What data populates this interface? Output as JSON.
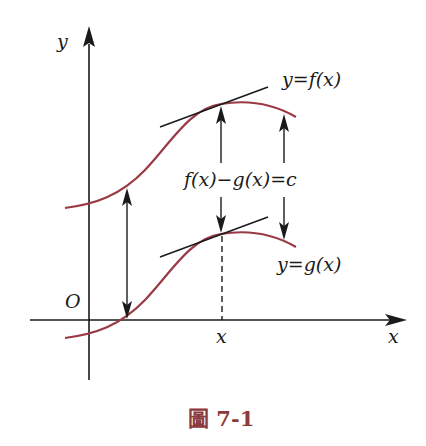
{
  "figure": {
    "caption": "圖 7-1",
    "labels": {
      "y_axis": "y",
      "x_axis": "x",
      "origin": "O",
      "x_point": "x",
      "f_curve": "y=f(x)",
      "g_curve": "y=g(x)",
      "difference": "f(x)−g(x)=c"
    },
    "colors": {
      "curve": "#9a3a45",
      "caption": "#8b3a3e",
      "ink": "#1a1a1a"
    }
  }
}
